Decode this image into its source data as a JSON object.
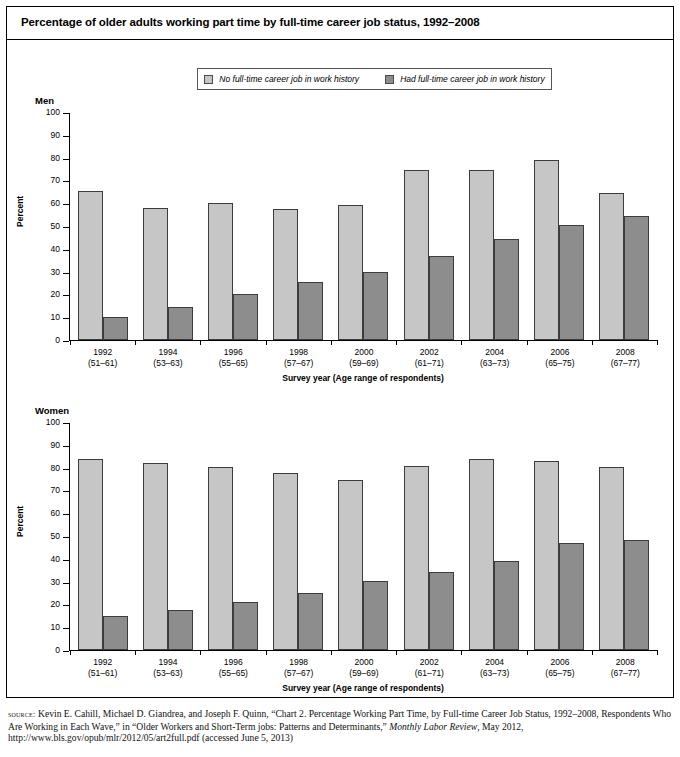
{
  "title": "Percentage of older adults working part time by full-time career job status, 1992–2008",
  "legend": {
    "items": [
      {
        "label": "No full-time career job in work history",
        "color": "#c6c6c6",
        "swatch": "legend-swatch-light"
      },
      {
        "label": "Had full-time career job in work history",
        "color": "#8d8d8d",
        "swatch": "legend-swatch-dark"
      }
    ]
  },
  "panels": {
    "men": {
      "title": "Men",
      "ylabel": "Percent",
      "xlabel": "Survey year (Age range of respondents)"
    },
    "women": {
      "title": "Women",
      "ylabel": "Percent",
      "xlabel": "Survey year (Age range of respondents)"
    }
  },
  "axis": {
    "yticks": [
      "100",
      "90",
      "80",
      "70",
      "60",
      "50",
      "40",
      "30",
      "20",
      "10",
      "0"
    ],
    "years": [
      "1992",
      "1994",
      "1996",
      "1998",
      "2000",
      "2002",
      "2004",
      "2006",
      "2008"
    ],
    "ageranges": [
      "(51–61)",
      "(53–63)",
      "(55–65)",
      "(57–67)",
      "(59–69)",
      "(61–71)",
      "(63–73)",
      "(65–75)",
      "(67–77)"
    ]
  },
  "source": {
    "prefix": "source:",
    "line1": " Kevin E. Cahill, Michael D. Giandrea, and Joseph F. Quinn, “Chart 2. Percentage Working Part Time, by Full-time Career Job Status,",
    "line2": "1992–2008, Respondents Who Are Working in Each Wave,” in “Older Workers and Short-Term jobs: Patterns and Determinants,” ",
    "journal": "Monthly Labor Review",
    "line3": ", May 2012, http://www.bls.gov/opub/mlr/2012/05/art2full.pdf (accessed June 5, 2013)"
  },
  "chart_data": [
    {
      "type": "bar",
      "title": "Men",
      "xlabel": "Survey year (Age range of respondents)",
      "ylabel": "Percent",
      "ylim": [
        0,
        100
      ],
      "ytick_step": 10,
      "grid": false,
      "legend_position": "top-center",
      "categories": [
        "1992",
        "1994",
        "1996",
        "1998",
        "2000",
        "2002",
        "2004",
        "2006",
        "2008"
      ],
      "category_sublabels": [
        "(51–61)",
        "(53–63)",
        "(55–65)",
        "(57–67)",
        "(59–69)",
        "(61–71)",
        "(63–73)",
        "(65–75)",
        "(67–77)"
      ],
      "series": [
        {
          "name": "No full-time career job in work history",
          "color": "#c6c6c6",
          "values": [
            65.5,
            58.2,
            60.5,
            57.8,
            59.6,
            75.0,
            74.8,
            79.2,
            64.8
          ]
        },
        {
          "name": "Had full-time career job in work history",
          "color": "#8d8d8d",
          "values": [
            10.3,
            14.5,
            20.3,
            25.7,
            30.0,
            37.2,
            44.4,
            50.6,
            54.6
          ]
        }
      ]
    },
    {
      "type": "bar",
      "title": "Women",
      "xlabel": "Survey year (Age range of respondents)",
      "ylabel": "Percent",
      "ylim": [
        0,
        100
      ],
      "ytick_step": 10,
      "grid": false,
      "legend_position": "top-center",
      "categories": [
        "1992",
        "1994",
        "1996",
        "1998",
        "2000",
        "2002",
        "2004",
        "2006",
        "2008"
      ],
      "category_sublabels": [
        "(51–61)",
        "(53–63)",
        "(55–65)",
        "(57–67)",
        "(59–69)",
        "(61–71)",
        "(63–73)",
        "(65–75)",
        "(67–77)"
      ],
      "series": [
        {
          "name": "No full-time career job in work history",
          "color": "#c6c6c6",
          "values": [
            84.0,
            82.2,
            80.5,
            77.8,
            75.0,
            81.2,
            84.0,
            83.2,
            80.6
          ]
        },
        {
          "name": "Had full-time career job in work history",
          "color": "#8d8d8d",
          "values": [
            15.2,
            17.5,
            21.2,
            25.0,
            30.4,
            34.2,
            39.3,
            47.0,
            48.6
          ]
        }
      ]
    }
  ]
}
